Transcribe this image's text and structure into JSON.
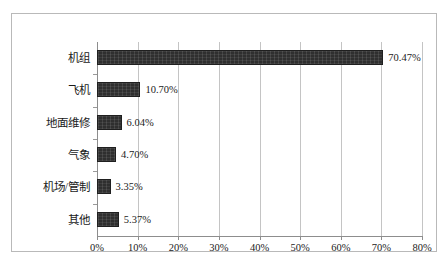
{
  "chart_data": {
    "type": "bar",
    "orientation": "horizontal",
    "title": "",
    "xlabel": "",
    "ylabel": "",
    "categories": [
      "机组",
      "飞机",
      "地面维修",
      "气象",
      "机场/管制",
      "其他"
    ],
    "values": [
      70.47,
      10.7,
      6.04,
      4.7,
      3.35,
      5.37
    ],
    "value_labels": [
      "70.47%",
      "10.70%",
      "6.04%",
      "4.70%",
      "3.35%",
      "5.37%"
    ],
    "xlim": [
      0,
      80
    ],
    "xticks": [
      0,
      10,
      20,
      30,
      40,
      50,
      60,
      70,
      80
    ],
    "xtick_labels": [
      "0%",
      "10%",
      "20%",
      "30%",
      "40%",
      "50%",
      "60%",
      "70%",
      "80%"
    ],
    "grid": true,
    "grid_axis": "x",
    "legend": false,
    "bar_color": "#2f2f2f",
    "grid_color": "#c4c4c4",
    "axis_color": "#8d8d8d",
    "border_color": "#b9b9b9",
    "background": "#ffffff"
  }
}
